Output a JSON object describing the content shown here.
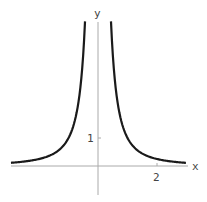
{
  "chart_data": {
    "type": "line",
    "title": "",
    "xlabel": "x",
    "ylabel": "y",
    "function": "y = 1/x^2",
    "xlim": [
      -3,
      3
    ],
    "ylim": [
      0,
      5.2
    ],
    "x_ticks": [
      {
        "value": 2,
        "label": "2"
      }
    ],
    "y_ticks": [
      {
        "value": 1,
        "label": "1"
      }
    ],
    "grid": false,
    "legend": null,
    "series": [
      {
        "name": "left branch",
        "x": [
          -3,
          -2.5,
          -2,
          -1.5,
          -1,
          -0.75,
          -0.6,
          -0.5,
          -0.44
        ],
        "y": [
          0.11,
          0.16,
          0.25,
          0.44,
          1.0,
          1.78,
          2.78,
          4.0,
          5.17
        ]
      },
      {
        "name": "right branch",
        "x": [
          0.44,
          0.5,
          0.6,
          0.75,
          1,
          1.5,
          2,
          2.5,
          3
        ],
        "y": [
          5.17,
          4.0,
          2.78,
          1.78,
          1.0,
          0.44,
          0.25,
          0.16,
          0.11
        ]
      }
    ],
    "colors": {
      "curve": "#1a1a1a",
      "axis": "#aaaaaa",
      "text": "#444444"
    }
  }
}
